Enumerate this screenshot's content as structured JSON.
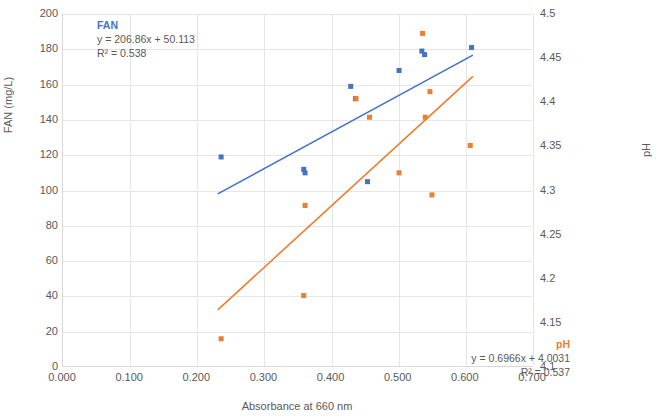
{
  "chart_data": {
    "type": "scatter",
    "title": "",
    "xlabel": "Absorbance at 660 nm",
    "ylabel_left": "FAN (mg/L)",
    "ylabel_right": "pH",
    "xlim": [
      0.0,
      0.7
    ],
    "ylim_left": [
      0,
      200
    ],
    "ylim_right": [
      4.1,
      4.5
    ],
    "xticks": [
      "0.000",
      "0.100",
      "0.200",
      "0.300",
      "0.400",
      "0.500",
      "0.600",
      "0.700"
    ],
    "xtick_values": [
      0.0,
      0.1,
      0.2,
      0.3,
      0.4,
      0.5,
      0.6,
      0.7
    ],
    "yticks_left": [
      "0",
      "20",
      "40",
      "60",
      "80",
      "100",
      "120",
      "140",
      "160",
      "180",
      "200"
    ],
    "ytick_values_left": [
      0,
      20,
      40,
      60,
      80,
      100,
      120,
      140,
      160,
      180,
      200
    ],
    "yticks_right": [
      "4.1",
      "4.15",
      "4.2",
      "4.25",
      "4.3",
      "4.35",
      "4.4",
      "4.45",
      "4.5"
    ],
    "ytick_values_right": [
      4.1,
      4.15,
      4.2,
      4.25,
      4.3,
      4.35,
      4.4,
      4.45,
      4.5
    ],
    "grid": true,
    "legend_position": "none",
    "series": [
      {
        "name": "FAN",
        "color": "#4472c4",
        "axis": "left",
        "marker": "square",
        "points": [
          {
            "x": 0.237,
            "y": 119
          },
          {
            "x": 0.36,
            "y": 112
          },
          {
            "x": 0.362,
            "y": 110
          },
          {
            "x": 0.43,
            "y": 159
          },
          {
            "x": 0.437,
            "y": 152
          },
          {
            "x": 0.455,
            "y": 105
          },
          {
            "x": 0.502,
            "y": 168
          },
          {
            "x": 0.536,
            "y": 179
          },
          {
            "x": 0.54,
            "y": 177
          },
          {
            "x": 0.61,
            "y": 181
          }
        ],
        "trendline": {
          "equation": "y = 206.86x + 50.113",
          "r2_label": "R² = 0.538",
          "slope": 206.86,
          "intercept": 50.113,
          "r2": 0.538,
          "x_start": 0.232,
          "x_end": 0.612
        }
      },
      {
        "name": "pH",
        "color": "#ed7d31",
        "axis": "right",
        "marker": "square",
        "points": [
          {
            "x": 0.237,
            "y": 4.132
          },
          {
            "x": 0.36,
            "y": 4.181
          },
          {
            "x": 0.362,
            "y": 4.283
          },
          {
            "x": 0.438,
            "y": 4.404
          },
          {
            "x": 0.458,
            "y": 4.383
          },
          {
            "x": 0.502,
            "y": 4.32
          },
          {
            "x": 0.537,
            "y": 4.478
          },
          {
            "x": 0.541,
            "y": 4.383
          },
          {
            "x": 0.548,
            "y": 4.412
          },
          {
            "x": 0.551,
            "y": 4.295
          },
          {
            "x": 0.608,
            "y": 4.351
          }
        ],
        "trendline": {
          "equation": "y = 0.6966x + 4.0031",
          "r2_label": "R² = 0.537",
          "slope": 0.6966,
          "intercept": 4.0031,
          "r2": 0.537,
          "x_start": 0.232,
          "x_end": 0.612
        }
      }
    ]
  }
}
